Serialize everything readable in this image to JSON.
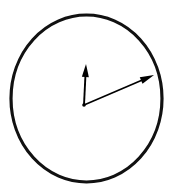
{
  "figure": {
    "name": "analog-clock-face",
    "type": "line-diagram",
    "background_color": "#ffffff",
    "stroke_color": "#000000",
    "canvas": {
      "width": 172,
      "height": 189
    },
    "caption": ""
  },
  "dial": {
    "label": "clock-dial",
    "shape": "circle",
    "center": {
      "x": 86.5,
      "y": 98.5
    },
    "radius_x": 75.5,
    "radius_y": 83.5,
    "stroke_width": 3.2,
    "fill": "none",
    "stroke_color": "#111111",
    "has_numerals": false,
    "has_tick_marks": false
  },
  "hub": {
    "label": "center-hub",
    "x": 84,
    "y": 105,
    "radius": 1.8,
    "color": "#000000"
  },
  "hands": [
    {
      "name": "hour-hand",
      "role": "short-hand",
      "from": {
        "x": 84,
        "y": 105
      },
      "to": {
        "x": 86,
        "y": 64
      },
      "length": 41,
      "angle_deg": 2.8,
      "clock_direction": "up",
      "stroke_width": 1.9,
      "color": "#000000",
      "arrowhead": {
        "shape": "triangle",
        "length": 13,
        "width": 7
      }
    },
    {
      "name": "minute-hand",
      "role": "long-hand",
      "from": {
        "x": 84,
        "y": 105
      },
      "to": {
        "x": 154,
        "y": 75
      },
      "length": 76,
      "angle_deg": 66.8,
      "clock_direction": "upper-right",
      "stroke_width": 1.7,
      "color": "#000000",
      "arrowhead": {
        "shape": "triangle",
        "length": 14,
        "width": 7
      }
    }
  ],
  "reading": {
    "approx_time": "",
    "notes": ""
  }
}
